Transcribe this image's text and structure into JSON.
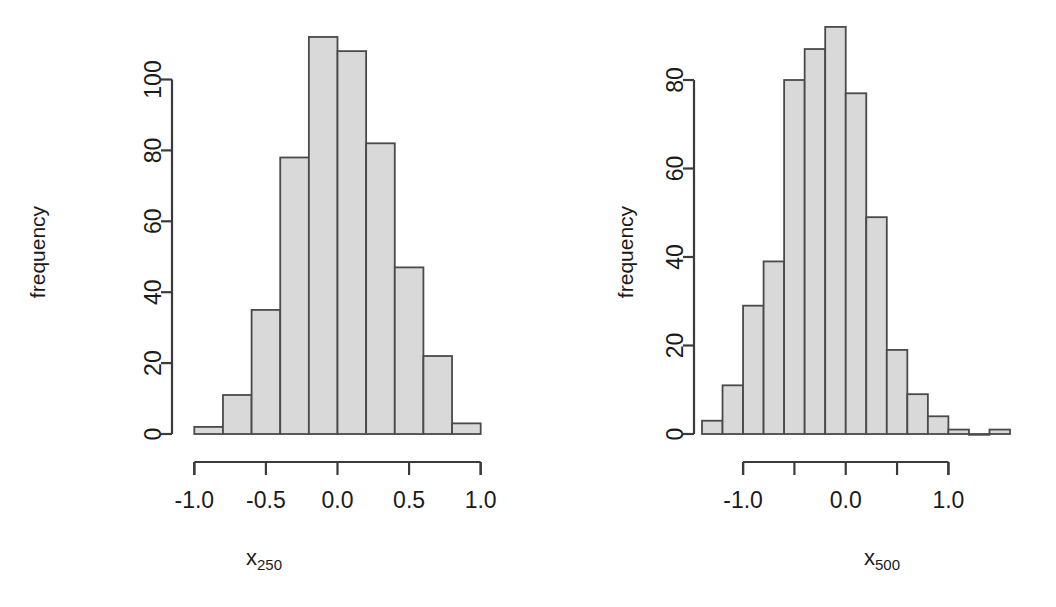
{
  "figure": {
    "background": "#ffffff",
    "bar_fill": "#d9d9d9",
    "bar_stroke": "#4a4a4a",
    "axis_color": "#3b3b3b",
    "panel_count": 2
  },
  "panels": [
    {
      "id": "left",
      "ylabel": "frequency",
      "xlabel_base": "x",
      "xlabel_sub": "250",
      "x_ticks": [
        "-1.0",
        "-0.5",
        "0.0",
        "0.5",
        "1.0"
      ],
      "y_ticks": [
        "0",
        "20",
        "40",
        "60",
        "80",
        "100"
      ]
    },
    {
      "id": "right",
      "ylabel": "frequency",
      "xlabel_base": "x",
      "xlabel_sub": "500",
      "x_ticks": [
        "-1.0",
        "",
        "0.0",
        "",
        "1.0"
      ],
      "y_ticks": [
        "0",
        "20",
        "40",
        "60",
        "80"
      ]
    }
  ],
  "chart_data": [
    {
      "type": "bar",
      "title": "",
      "subtitle": "",
      "xlabel": "x250",
      "ylabel": "frequency",
      "grid": false,
      "legend": "none",
      "xlim": [
        -1.1,
        1.1
      ],
      "ylim": [
        0,
        112
      ],
      "x_tick_values": [
        -1.0,
        -0.5,
        0.0,
        0.5,
        1.0
      ],
      "x_tick_labels": [
        "-1.0",
        "-0.5",
        "0.0",
        "0.5",
        "1.0"
      ],
      "y_tick_values": [
        0,
        20,
        40,
        60,
        80,
        100
      ],
      "y_tick_labels": [
        "0",
        "20",
        "40",
        "60",
        "80",
        "100"
      ],
      "bin_width": 0.2,
      "bin_edges": [
        -1.0,
        -0.8,
        -0.6,
        -0.4,
        -0.2,
        0.0,
        0.2,
        0.4,
        0.6,
        0.8,
        1.0
      ],
      "categories": [
        "-1.0..-0.8",
        "-0.8..-0.6",
        "-0.6..-0.4",
        "-0.4..-0.2",
        "-0.2..0.0",
        "0.0..0.2",
        "0.2..0.4",
        "0.4..0.6",
        "0.6..0.8",
        "0.8..1.0"
      ],
      "values": [
        2,
        11,
        35,
        78,
        112,
        108,
        82,
        47,
        22,
        3
      ]
    },
    {
      "type": "bar",
      "title": "",
      "subtitle": "",
      "xlabel": "x500",
      "ylabel": "frequency",
      "grid": false,
      "legend": "none",
      "xlim": [
        -1.4,
        1.6
      ],
      "ylim": [
        0,
        92
      ],
      "x_tick_values": [
        -1.0,
        -0.5,
        0.0,
        0.5,
        1.0
      ],
      "x_tick_labels": [
        "-1.0",
        "",
        "0.0",
        "",
        "1.0"
      ],
      "y_tick_values": [
        0,
        20,
        40,
        60,
        80
      ],
      "y_tick_labels": [
        "0",
        "20",
        "40",
        "60",
        "80"
      ],
      "bin_width": 0.2,
      "bin_edges": [
        -1.4,
        -1.2,
        -1.0,
        -0.8,
        -0.6,
        -0.4,
        -0.2,
        0.0,
        0.2,
        0.4,
        0.6,
        0.8,
        1.0,
        1.2,
        1.4,
        1.6
      ],
      "categories": [
        "-1.4..-1.2",
        "-1.2..-1.0",
        "-1.0..-0.8",
        "-0.8..-0.6",
        "-0.6..-0.4",
        "-0.4..-0.2",
        "-0.2..0.0",
        "0.0..0.2",
        "0.2..0.4",
        "0.4..0.6",
        "0.6..0.8",
        "0.8..1.0",
        "1.0..1.2",
        "1.2..1.4",
        "1.4..1.6"
      ],
      "values": [
        3,
        11,
        29,
        39,
        80,
        87,
        92,
        77,
        49,
        19,
        9,
        4,
        1,
        0,
        1
      ]
    }
  ]
}
